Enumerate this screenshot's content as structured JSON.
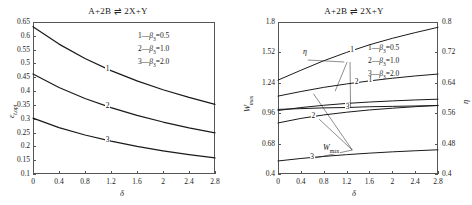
{
  "figure": {
    "panels": [
      {
        "id": "left",
        "title": "A+2B ⇌ 2X+Y",
        "xlabel": "δ",
        "ylabel": "ε",
        "ylabel_sub": "t,opt",
        "xticks": [
          "0",
          "0.4",
          "0.8",
          "1.2",
          "1.6",
          "2",
          "2.4",
          "2.8"
        ],
        "yticks": [
          "0.65",
          "0.6",
          "0.55",
          "0.5",
          "0.45",
          "0.4",
          "0.35",
          "0.3",
          "0.25",
          "0.2",
          "0.15",
          "0.1"
        ],
        "legend": [
          {
            "marker": "1",
            "sym": "β",
            "sub": "3",
            "value": "0.5"
          },
          {
            "marker": "2",
            "sym": "β",
            "sub": "3",
            "value": "1.0"
          },
          {
            "marker": "3",
            "sym": "β",
            "sub": "3",
            "value": "2.0"
          }
        ],
        "curve_labels": [
          "1",
          "2",
          "3"
        ]
      },
      {
        "id": "right",
        "title": "A+2B ⇌ 2X+Y",
        "xlabel": "δ",
        "ylabel": "W",
        "ylabel_sub": "max",
        "ylabel2": "η",
        "xticks": [
          "0",
          "0.4",
          "0.8",
          "1.2",
          "1.6",
          "2",
          "2.4",
          "2.8"
        ],
        "yticks": [
          "1.8",
          "1.52",
          "1.24",
          "0.96",
          "0.68",
          "0.4"
        ],
        "y2ticks": [
          "0.8",
          "0.72",
          "0.64",
          "0.56",
          "0.48",
          "0.4"
        ],
        "legend": [
          {
            "marker": "1",
            "sym": "β",
            "sub": "3",
            "value": "0.5"
          },
          {
            "marker": "2",
            "sym": "β",
            "sub": "3",
            "value": "1.0"
          },
          {
            "marker": "3",
            "sym": "β",
            "sub": "3",
            "value": "2.0"
          }
        ],
        "annotations": [
          {
            "name": "eta",
            "text": "η"
          },
          {
            "name": "wmax",
            "text": "W",
            "sub": "max"
          }
        ],
        "curve_labels": [
          "1",
          "2",
          "3",
          "1",
          "2",
          "3"
        ]
      }
    ]
  },
  "chart_data": [
    {
      "type": "line",
      "panel": "left",
      "title": "A+2B ⇌ 2X+Y",
      "xlabel": "δ",
      "ylabel": "ε_t,opt",
      "xlim": [
        0,
        2.8
      ],
      "ylim": [
        0.1,
        0.65
      ],
      "grid": false,
      "legend_position": "upper-right",
      "x": [
        0,
        0.4,
        0.8,
        1.2,
        1.6,
        2.0,
        2.4,
        2.8
      ],
      "series": [
        {
          "name": "1 — β3=0.5",
          "values": [
            0.633,
            0.57,
            0.518,
            0.474,
            0.437,
            0.405,
            0.377,
            0.352
          ]
        },
        {
          "name": "2 — β3=1.0",
          "values": [
            0.462,
            0.413,
            0.373,
            0.34,
            0.312,
            0.288,
            0.267,
            0.249
          ]
        },
        {
          "name": "3 — β3=2.0",
          "values": [
            0.302,
            0.268,
            0.241,
            0.219,
            0.2,
            0.184,
            0.17,
            0.158
          ]
        }
      ]
    },
    {
      "type": "line",
      "panel": "right",
      "title": "A+2B ⇌ 2X+Y",
      "xlabel": "δ",
      "ylabel": "W_max",
      "ylabel2": "η",
      "xlim": [
        0,
        2.8
      ],
      "ylim": [
        0.4,
        1.8
      ],
      "ylim2": [
        0.4,
        0.8
      ],
      "grid": false,
      "legend_position": "upper-right",
      "x": [
        0,
        0.4,
        0.8,
        1.2,
        1.6,
        2.0,
        2.4,
        2.8
      ],
      "series": [
        {
          "name": "eta-1 (β3=0.5)",
          "axis": "right",
          "values": [
            0.647,
            0.673,
            0.698,
            0.72,
            0.74,
            0.757,
            0.772,
            0.786
          ]
        },
        {
          "name": "eta-2 (β3=1.0)",
          "axis": "right",
          "values": [
            0.605,
            0.617,
            0.628,
            0.637,
            0.645,
            0.652,
            0.658,
            0.663
          ]
        },
        {
          "name": "eta-3 (β3=2.0)",
          "axis": "right",
          "values": [
            0.57,
            0.572,
            0.574,
            0.575,
            0.577,
            0.578,
            0.579,
            0.58
          ]
        },
        {
          "name": "Wmax-1 (β3=0.5)",
          "axis": "left",
          "values": [
            0.985,
            1.012,
            1.033,
            1.05,
            1.063,
            1.073,
            1.082,
            1.089
          ]
        },
        {
          "name": "Wmax-2 (β3=1.0)",
          "axis": "left",
          "values": [
            0.87,
            0.912,
            0.944,
            0.969,
            0.99,
            1.006,
            1.02,
            1.032
          ]
        },
        {
          "name": "Wmax-3 (β3=2.0)",
          "axis": "left",
          "values": [
            0.52,
            0.543,
            0.562,
            0.578,
            0.592,
            0.604,
            0.614,
            0.623
          ]
        }
      ]
    }
  ]
}
